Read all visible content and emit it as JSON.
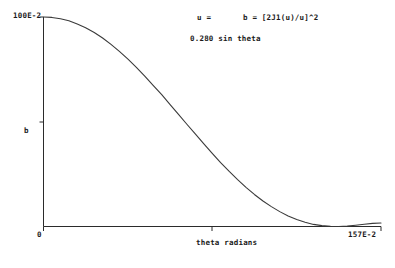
{
  "chart_data": {
    "type": "line",
    "title": "",
    "subtitle": "",
    "xlabel": "theta radians",
    "ylabel": "b",
    "xlim": [
      0,
      1.57
    ],
    "ylim": [
      0,
      1.0
    ],
    "x_tick_labels": [
      "0",
      "157E-2"
    ],
    "y_tick_labels": [
      "100E-2"
    ],
    "grid": false,
    "legend": null,
    "annotations": [
      {
        "name": "u-definition",
        "text": "u ="
      },
      {
        "name": "intensity-formula",
        "text": "b = [2J1(u)/u]^2"
      },
      {
        "name": "u-expression",
        "text": "0.280 sin theta"
      }
    ],
    "series": [
      {
        "name": "airy-intensity",
        "color": "#3a3a3a",
        "x": [
          0.0,
          0.039,
          0.079,
          0.118,
          0.157,
          0.196,
          0.236,
          0.275,
          0.314,
          0.353,
          0.393,
          0.432,
          0.471,
          0.51,
          0.55,
          0.589,
          0.628,
          0.667,
          0.707,
          0.746,
          0.785,
          0.824,
          0.864,
          0.903,
          0.942,
          0.981,
          1.021,
          1.06,
          1.099,
          1.138,
          1.178,
          1.217,
          1.256,
          1.295,
          1.335,
          1.374,
          1.413,
          1.452,
          1.492,
          1.531,
          1.57
        ],
        "y": [
          1.0,
          0.998,
          0.992,
          0.982,
          0.967,
          0.949,
          0.926,
          0.9,
          0.869,
          0.836,
          0.799,
          0.76,
          0.718,
          0.674,
          0.629,
          0.582,
          0.535,
          0.488,
          0.441,
          0.394,
          0.349,
          0.305,
          0.263,
          0.224,
          0.187,
          0.153,
          0.122,
          0.095,
          0.071,
          0.05,
          0.033,
          0.02,
          0.01,
          0.004,
          0.001,
          0.0,
          0.002,
          0.006,
          0.011,
          0.015,
          0.017
        ]
      }
    ],
    "axis_color": "#2b2b2b",
    "background": "#ffffff"
  },
  "labels": {
    "y_max": "100E-2",
    "y_title": "b",
    "x_min": "0",
    "x_max": "157E-2",
    "x_title": "theta radians",
    "annot_u": "u =",
    "annot_formula": "b = [2J1(u)/u]^2",
    "annot_expr": "0.280 sin theta"
  }
}
